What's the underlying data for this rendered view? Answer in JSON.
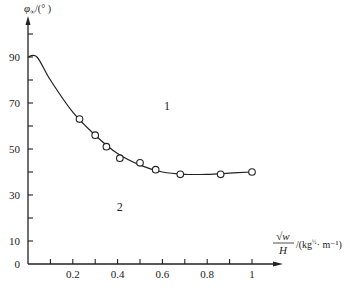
{
  "chart_data": {
    "type": "line",
    "title": "",
    "ylabel": "φ∞/(°)",
    "xlabel": "√w / H /(kg^½·m⁻¹)",
    "xlabel_parts": {
      "numerator": "√w",
      "denominator": "H",
      "unit": "/(kg",
      "unit_exp": "½",
      "unit_rest": "· m⁻¹)"
    },
    "ylabel_parts": {
      "symbol": "φ",
      "subscript": "∞",
      "unit": "/(° )"
    },
    "xlim": [
      0,
      1.1
    ],
    "ylim": [
      0,
      100
    ],
    "x_ticks": [
      0.1,
      0.2,
      0.3,
      0.4,
      0.5,
      0.6,
      0.7,
      0.8,
      0.9,
      1.0
    ],
    "x_tick_labels": [
      "0.2",
      "0.4",
      "0.6",
      "0.8",
      "1"
    ],
    "x_tick_label_values": [
      0.2,
      0.4,
      0.6,
      0.8,
      1.0
    ],
    "y_ticks": [
      10,
      20,
      30,
      40,
      50,
      60,
      70,
      80,
      90,
      100
    ],
    "y_tick_labels": [
      "0",
      "10",
      "30",
      "50",
      "70",
      "90"
    ],
    "y_tick_label_values": [
      0,
      10,
      30,
      50,
      70,
      90
    ],
    "grid": false,
    "series": [
      {
        "name": "fitted curve",
        "style": "solid line",
        "x": [
          0.0,
          0.04,
          0.1,
          0.2,
          0.3,
          0.4,
          0.5,
          0.6,
          0.7,
          0.8,
          0.9,
          1.0
        ],
        "values": [
          90,
          90,
          80,
          66,
          56,
          48,
          43,
          40,
          39,
          39,
          39.5,
          40
        ]
      },
      {
        "name": "measured points",
        "style": "open circles",
        "x": [
          0.23,
          0.3,
          0.35,
          0.41,
          0.5,
          0.57,
          0.68,
          0.86,
          1.0
        ],
        "values": [
          63,
          56,
          51,
          46,
          44,
          41,
          39,
          39,
          40
        ]
      }
    ],
    "annotations": [
      {
        "text": "1",
        "x": 0.62,
        "y": 67,
        "meaning": "region above curve"
      },
      {
        "text": "2",
        "x": 0.41,
        "y": 23,
        "meaning": "region below curve"
      }
    ],
    "legend": null
  }
}
